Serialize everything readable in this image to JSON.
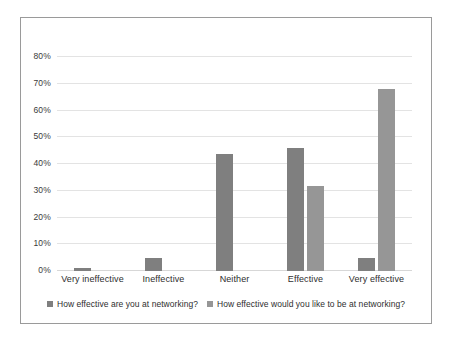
{
  "chart_data": {
    "type": "bar",
    "title": "",
    "xlabel": "",
    "ylabel": "",
    "categories": [
      "Very ineffective",
      "Ineffective",
      "Neither",
      "Effective",
      "Very effective"
    ],
    "series": [
      {
        "name": "How effective are you at networking?",
        "color": "#7f7f7f",
        "values": [
          1,
          5,
          44,
          46,
          5
        ]
      },
      {
        "name": "How effective would you like to be at networking?",
        "color": "#969696",
        "values": [
          0,
          0,
          0,
          32,
          68
        ]
      }
    ],
    "ylim": [
      0,
      85
    ],
    "yticks": [
      0,
      10,
      20,
      30,
      40,
      50,
      60,
      70,
      80
    ],
    "ytick_labels": [
      "0%",
      "10%",
      "20%",
      "30%",
      "40%",
      "50%",
      "60%",
      "70%",
      "80%"
    ],
    "grid": true,
    "legend_position": "bottom"
  }
}
